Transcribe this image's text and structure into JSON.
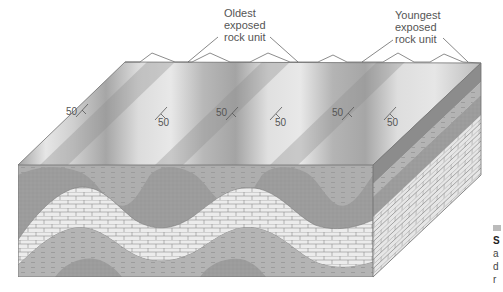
{
  "figure": {
    "type": "block diagram of plunging/eroded folds (anticlines and synclines)",
    "labels": {
      "oldest": [
        "Oldest",
        "exposed",
        "rock unit"
      ],
      "youngest": [
        "Youngest",
        "exposed",
        "rock unit"
      ]
    },
    "dip_annotations": [
      {
        "value": "50",
        "x": 65,
        "y": 115
      },
      {
        "value": "50",
        "x": 160,
        "y": 125
      },
      {
        "value": "50",
        "x": 218,
        "y": 115
      },
      {
        "value": "50",
        "x": 275,
        "y": 125
      },
      {
        "value": "50",
        "x": 333,
        "y": 115
      },
      {
        "value": "50",
        "x": 388,
        "y": 125
      }
    ],
    "colors": {
      "background": "#ffffff",
      "top_light": "#e4e4e4",
      "top_dark": "#a8a8a8",
      "sandstone": "#9a9a9a",
      "shale": "#b5b5b5",
      "limestone": "#e9e9e9",
      "brick_line": "#8a8a8a",
      "outline": "#6e6e6e"
    },
    "caption_fragment": {
      "line1": "S",
      "line2": "a",
      "line3": "d",
      "line4": "r"
    }
  }
}
